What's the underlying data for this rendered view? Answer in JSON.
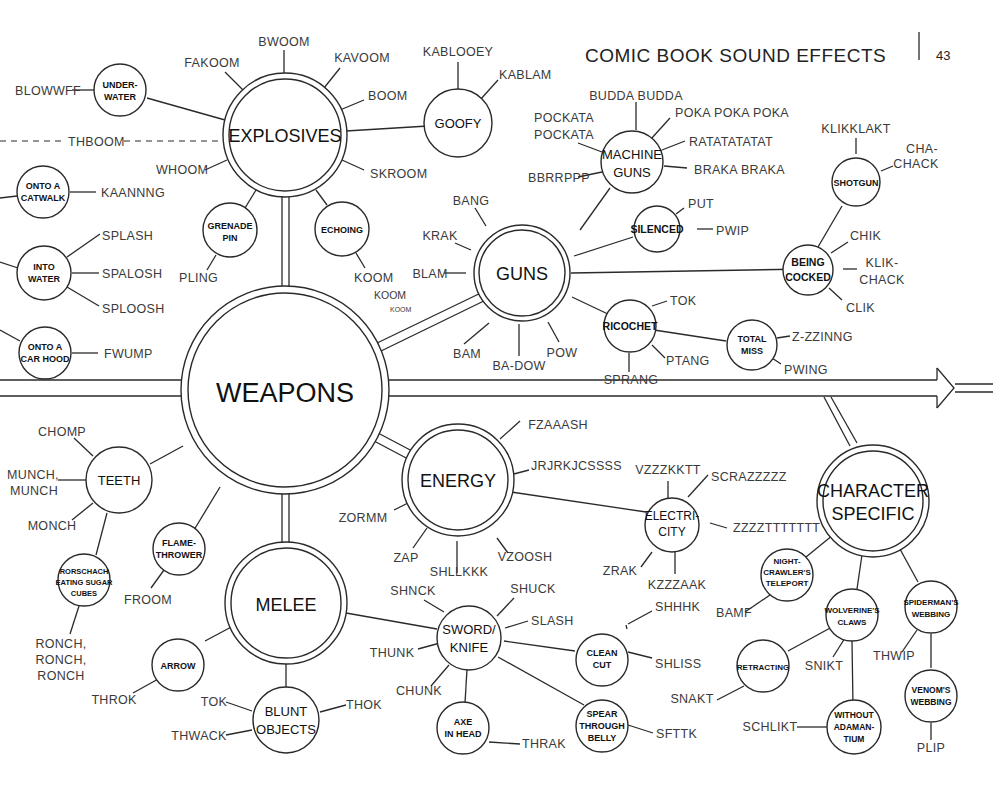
{
  "header": {
    "title": "COMIC BOOK SOUND EFFECTS",
    "page_number": "43"
  },
  "nodes": {
    "weapons": "WEAPONS",
    "explosives": "EXPLOSIVES",
    "guns": "GUNS",
    "energy": "ENERGY",
    "melee": "MELEE",
    "character_specific": [
      "CHARACTER",
      "SPECIFIC"
    ],
    "goofy": "GOOFY",
    "underwater": [
      "UNDER-",
      "WATER"
    ],
    "grenade_pin": [
      "GRENADE",
      "PIN"
    ],
    "echoing": "ECHOING",
    "onto_catwalk": [
      "ONTO A",
      "CATWALK"
    ],
    "into_water": [
      "INTO",
      "WATER"
    ],
    "onto_car_hood": [
      "ONTO A",
      "CAR HOOD"
    ],
    "machine_guns": [
      "MACHINE",
      "GUNS"
    ],
    "silenced": "SILENCED",
    "shotgun": "SHOTGUN",
    "being_cocked": [
      "BEING",
      "COCKED"
    ],
    "ricochet": "RICOCHET",
    "total_miss": [
      "TOTAL",
      "MISS"
    ],
    "teeth": "TEETH",
    "rorschach": [
      "RORSCHACH",
      "EATING SUGAR",
      "CUBES"
    ],
    "flamethrower": [
      "FLAME-",
      "THROWER"
    ],
    "electricity": [
      "ELECTRI-",
      "CITY"
    ],
    "arrow": "ARROW",
    "blunt_objects": [
      "BLUNT",
      "OBJECTS"
    ],
    "sword_knife": [
      "SWORD/",
      "KNIFE"
    ],
    "clean_cut": [
      "CLEAN",
      "CUT"
    ],
    "axe_in_head": [
      "AXE",
      "IN HEAD"
    ],
    "spear_through_belly": [
      "SPEAR",
      "THROUGH",
      "BELLY"
    ],
    "nightcrawler": [
      "NIGHT-",
      "CRAWLER'S",
      "TELEPORT"
    ],
    "wolverine": [
      "WOLVERINE'S",
      "CLAWS"
    ],
    "spiderman": [
      "SPIDERMAN'S",
      "WEBBING"
    ],
    "retracting": "RETRACTING",
    "without_adamantium": [
      "WITHOUT",
      "ADAMAN-",
      "TIUM"
    ],
    "venom": [
      "VENOM'S",
      "WEBBING"
    ]
  },
  "sounds": {
    "explosives": [
      "BWOOM",
      "FAKOOM",
      "KAVOOM",
      "BOOM",
      "SKROOM",
      "WHOOM",
      "THBOOM"
    ],
    "underwater": [
      "BLOWWFF"
    ],
    "goofy": [
      "KABLOOEY",
      "KABLAM"
    ],
    "grenade_pin": [
      "PLING"
    ],
    "echoing": [
      "KOOM",
      "KOOM",
      "KOOM"
    ],
    "onto_catwalk": [
      "KAANNNG"
    ],
    "into_water": [
      "SPLASH",
      "SPALOSH",
      "SPLOOSH"
    ],
    "onto_car_hood": [
      "FWUMP"
    ],
    "machine_guns": [
      "BUDDA BUDDA",
      "POKA POKA POKA",
      "POCKATA",
      "POCKATA",
      "RATATATATAT",
      "BRAKA BRAKA",
      "BBRRPPP"
    ],
    "shotgun": [
      "KLIKKLAKT",
      "CHA-",
      "CHACK"
    ],
    "silenced": [
      "PUT",
      "PWIP"
    ],
    "being_cocked": [
      "CHIK",
      "KLIK-",
      "CHACK",
      "CLIK"
    ],
    "guns": [
      "BANG",
      "KRAK",
      "BLAM",
      "BAM",
      "BA-DOW",
      "POW"
    ],
    "ricochet": [
      "TOK",
      "PTANG",
      "SPRANG"
    ],
    "total_miss": [
      "Z-ZZINNG",
      "PWING"
    ],
    "teeth": [
      "CHOMP",
      "MUNCH,",
      "MUNCH",
      "MONCH"
    ],
    "rorschach": [
      "RONCH,",
      "RONCH,",
      "RONCH"
    ],
    "flamethrower": [
      "FROOM"
    ],
    "energy": [
      "FZAAASH",
      "JRJRKJCSSSS",
      "ZORMM",
      "ZAP",
      "SHLLKKK",
      "VZOOSH"
    ],
    "electricity": [
      "VZZZKKTT",
      "SCRAZZZZZ",
      "ZZZZTTTTTTT",
      "ZRAK",
      "KZZZAAK"
    ],
    "arrow": [
      "THROK"
    ],
    "blunt_objects": [
      "TOK",
      "THWACK",
      "THOK"
    ],
    "sword_knife": [
      "SHNCK",
      "SHUCK",
      "SLASH",
      "THUNK",
      "CHUNK"
    ],
    "clean_cut": [
      "SHHHK",
      "SHLISS"
    ],
    "axe_in_head": [
      "THRAK"
    ],
    "spear_through_belly": [
      "SFTTK"
    ],
    "nightcrawler": [
      "BAMF"
    ],
    "wolverine": [
      "SNIKT"
    ],
    "retracting": [
      "SNAKT"
    ],
    "without_adamantium": [
      "SCHLIKT"
    ],
    "spiderman": [
      "THWIP"
    ],
    "venom": [
      "PLIP"
    ]
  }
}
